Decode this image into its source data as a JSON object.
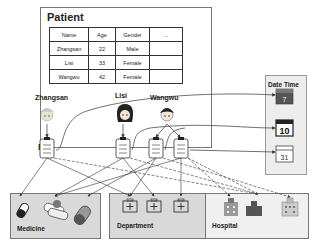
{
  "patient": {
    "title": "Patient",
    "columns": [
      "Name",
      "Age",
      "Gender",
      "..."
    ],
    "rows": [
      [
        "Zhangsan",
        "22",
        "Male",
        ""
      ],
      [
        "Lisi",
        "33",
        "Female",
        ""
      ],
      [
        "Wangwu",
        "42",
        "Female",
        ""
      ]
    ],
    "people": [
      "Zhangsan",
      "Lisi",
      "Wangwu"
    ]
  },
  "bill": {
    "label": "Bill",
    "count": 4
  },
  "datetime": {
    "title": "Date Time",
    "calendars": [
      "7",
      "10",
      "31"
    ]
  },
  "groups": {
    "medicine": {
      "label": "Medicine",
      "icons": [
        "pill-bottle-icon",
        "capsules-icon",
        "capsule-icon"
      ]
    },
    "department": {
      "label": "Department",
      "icons": [
        "first-aid-kit-icon",
        "first-aid-kit-icon",
        "first-aid-kit-icon"
      ]
    },
    "hospital": {
      "label": "Hospital",
      "icons": [
        "hospital-building-icon",
        "hospital-cross-building-icon",
        "hospital-block-icon"
      ]
    }
  }
}
